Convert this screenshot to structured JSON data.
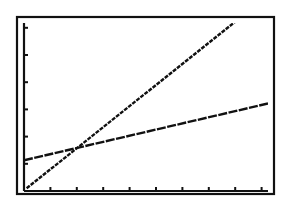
{
  "chart_data": {
    "type": "line",
    "title": "",
    "xlabel": "",
    "ylabel": "",
    "grid": false,
    "legend": null,
    "xlim": [
      0,
      9.3
    ],
    "ylim": [
      0,
      6.2
    ],
    "x_ticks": [
      1,
      2,
      3,
      4,
      5,
      6,
      7,
      8,
      9
    ],
    "y_ticks": [
      1,
      2,
      3,
      4,
      5,
      6
    ],
    "series": [
      {
        "name": "steep line",
        "x": [
          0.1,
          8.1
        ],
        "y": [
          0.1,
          6.3
        ]
      },
      {
        "name": "shallow line",
        "x": [
          0,
          9.3
        ],
        "y": [
          1.13,
          3.23
        ]
      }
    ],
    "annotations": []
  },
  "colors": {
    "background": "#ffffff",
    "ink": "#111111"
  },
  "geometry": {
    "frame": {
      "x": 17,
      "y": 17,
      "w": 257,
      "h": 177
    },
    "origin": {
      "x": 24,
      "y": 191
    },
    "px_per_unit_x": 26.4,
    "px_per_unit_y": 27.2
  }
}
